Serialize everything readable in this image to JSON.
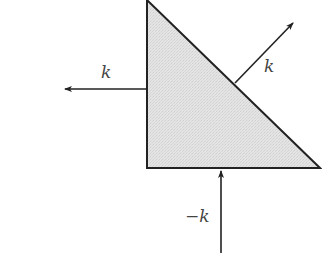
{
  "diagram": {
    "colors": {
      "fill": "#e2e2e2",
      "stroke": "#222222",
      "arrow": "#222222",
      "label": "#444444"
    },
    "shape": {
      "type": "right-triangle",
      "vertices": [
        [
          147,
          0
        ],
        [
          147,
          168
        ],
        [
          320,
          168
        ]
      ],
      "fill_style": "light-gray-stipple"
    },
    "arrows": [
      {
        "name": "left-arrow",
        "from": [
          147,
          89
        ],
        "to": [
          64,
          89
        ],
        "label": "k"
      },
      {
        "name": "diagonal-arrow",
        "from": [
          235,
          83
        ],
        "to": [
          294,
          22
        ],
        "label": "k"
      },
      {
        "name": "bottom-arrow",
        "from": [
          221,
          253
        ],
        "to": [
          221,
          170
        ],
        "label": "−k"
      }
    ]
  },
  "labels": {
    "left": "k",
    "diagonal": "k",
    "bottom": "−k"
  }
}
